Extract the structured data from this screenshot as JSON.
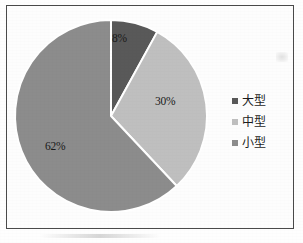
{
  "figure": {
    "background_color": "#fefefe",
    "frame_color": "#4a4a4a"
  },
  "legend": {
    "position": "right",
    "items": [
      {
        "label": "大型",
        "color": "#595959"
      },
      {
        "label": "中型",
        "color": "#bfbfbf"
      },
      {
        "label": "小型",
        "color": "#8c8c8c"
      }
    ]
  },
  "chart_data": {
    "type": "pie",
    "title": "",
    "subtitle": "",
    "xlabel": "",
    "ylabel": "",
    "grid": false,
    "legend_position": "right",
    "start_angle_deg": 0,
    "direction": "clockwise",
    "center": {
      "x": 117,
      "y": 121
    },
    "radius": 96,
    "separator_color": "#ffffff",
    "categories": [
      "大型",
      "中型",
      "小型"
    ],
    "values": [
      8,
      30,
      62
    ],
    "value_unit": "%",
    "colors": [
      "#595959",
      "#bfbfbf",
      "#8c8c8c"
    ],
    "data_labels": [
      "8%",
      "30%",
      "62%"
    ],
    "slices": [
      {
        "name": "大型",
        "value": 8,
        "label": "8%",
        "color": "#595959",
        "start_deg": 0,
        "end_deg": 28.8
      },
      {
        "name": "中型",
        "value": 30,
        "label": "30%",
        "color": "#bfbfbf",
        "start_deg": 28.8,
        "end_deg": 136.8
      },
      {
        "name": "小型",
        "value": 62,
        "label": "62%",
        "color": "#8c8c8c",
        "start_deg": 136.8,
        "end_deg": 360
      }
    ]
  }
}
